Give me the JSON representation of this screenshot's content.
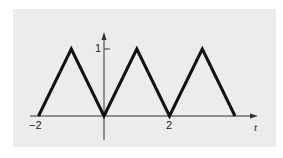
{
  "chart_data": {
    "type": "line",
    "title": "",
    "xlabel": "t",
    "ylabel": "",
    "xlim": [
      -2.4,
      4.6
    ],
    "ylim": [
      -0.8,
      1.25
    ],
    "grid": false,
    "legend": null,
    "x_ticks": [
      {
        "value": -2,
        "label": "−2"
      },
      {
        "value": 2,
        "label": "2"
      }
    ],
    "y_ticks": [
      {
        "value": 1,
        "label": "1"
      }
    ],
    "series": [
      {
        "name": "triangle-wave",
        "x": [
          -2,
          -1,
          0,
          1,
          2,
          3,
          4
        ],
        "y": [
          0,
          1,
          0,
          1,
          0,
          1,
          0
        ]
      }
    ],
    "colors": {
      "line": "#111111",
      "axis": "#333333",
      "panel_background": "#ececec"
    }
  },
  "labels": {
    "x_tick_neg2": "−2",
    "x_tick_2": "2",
    "y_tick_1": "1",
    "x_axis_label": "t"
  }
}
